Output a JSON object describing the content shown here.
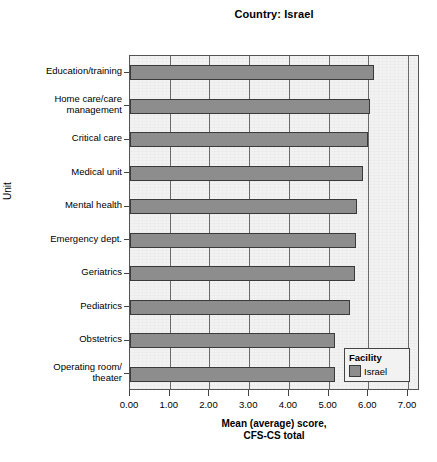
{
  "chart_data": {
    "type": "bar",
    "orientation": "horizontal",
    "title": "Country: Israel",
    "xlabel": "Mean (average) score,\nCFS-CS total",
    "ylabel": "Unit",
    "xlim": [
      0.0,
      7.3
    ],
    "xticks": [
      0.0,
      1.0,
      2.0,
      3.0,
      4.0,
      5.0,
      6.0,
      7.0
    ],
    "xticklabels": [
      "0.00",
      "1.00",
      "2.00",
      "3.00",
      "4.00",
      "5.00",
      "6.00",
      "7.00"
    ],
    "grid": "vertical",
    "legend": {
      "position": "bottom-right",
      "title": "Facility",
      "entries": [
        {
          "label": "Israel",
          "color": "#8d8d8d"
        }
      ]
    },
    "categories": [
      "Education/training",
      "Home care/care\nmanagement",
      "Critical care",
      "Medical unit",
      "Mental health",
      "Emergency dept.",
      "Geriatrics",
      "Pediatrics",
      "Obstetrics",
      "Operating room/\ntheater"
    ],
    "series": [
      {
        "name": "Israel",
        "color": "#8d8d8d",
        "values": [
          6.15,
          6.05,
          6.0,
          5.87,
          5.72,
          5.7,
          5.66,
          5.54,
          5.17,
          5.16
        ]
      }
    ]
  },
  "colors": {
    "bar_fill": "#8d8d8d",
    "bar_edge": "#3a3a3a",
    "plot_background": "#f2f2f2",
    "gridline": "#6a6a6a",
    "axis": "#555555"
  }
}
